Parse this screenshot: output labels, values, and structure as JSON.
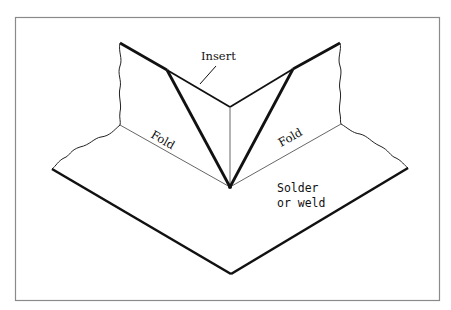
{
  "figure": {
    "type": "technical-illustration",
    "labels": {
      "insert": "Insert",
      "fold_left": "Fold",
      "fold_right": "Fold",
      "solder_line1": "Solder",
      "solder_line2": "or weld"
    },
    "colors": {
      "line": "#111111",
      "thin_line": "#555555",
      "frame": "#888888",
      "background": "#ffffff"
    }
  }
}
